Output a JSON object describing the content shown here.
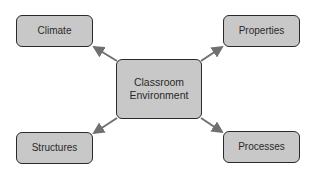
{
  "diagram": {
    "center": {
      "label_line1": "Classroom",
      "label_line2": "Environment"
    },
    "nodes": [
      {
        "id": "climate",
        "label": "Climate"
      },
      {
        "id": "properties",
        "label": "Properties"
      },
      {
        "id": "structures",
        "label": "Structures"
      },
      {
        "id": "processes",
        "label": "Processes"
      }
    ],
    "edges": [
      {
        "from": "center",
        "to": "climate"
      },
      {
        "from": "center",
        "to": "properties"
      },
      {
        "from": "center",
        "to": "structures"
      },
      {
        "from": "center",
        "to": "processes"
      }
    ],
    "colors": {
      "node_fill": "#c8c8c8",
      "border": "#2a2a2a",
      "arrow": "#707070"
    }
  }
}
